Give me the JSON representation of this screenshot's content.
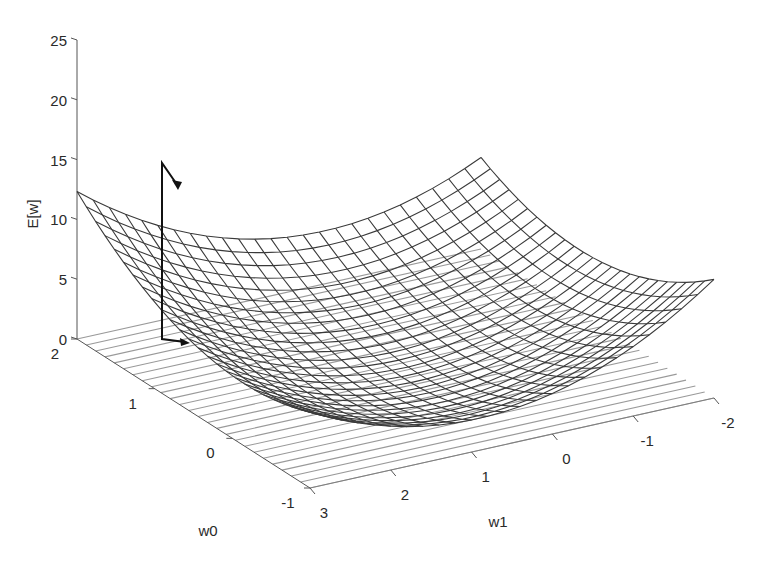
{
  "chart_data": {
    "type": "surface3d",
    "title": "",
    "xlabel": "w0",
    "ylabel": "w1",
    "zlabel": "E[w]",
    "x_ticks": [
      "-1",
      "0",
      "1",
      "2"
    ],
    "y_ticks": [
      "3",
      "2",
      "1",
      "0",
      "-1",
      "-2"
    ],
    "z_ticks": [
      "0",
      "5",
      "10",
      "15",
      "20",
      "25"
    ],
    "xlim": [
      -1,
      2
    ],
    "ylim": [
      -2,
      3
    ],
    "zlim": [
      0,
      25
    ],
    "grid": false,
    "legend": null,
    "surface": {
      "description": "Quadratic error surface (paraboloid bowl) of E[w] over weights w0 and w1, drawn as a wireframe mesh with a contour/line projection on the floor plane",
      "mesh_resolution": [
        25,
        25
      ],
      "corner_values": {
        "w0=2,w1=3": 20.5,
        "w0=2,w1=-2": 7.5,
        "w0=-1,w1=-2": 3.5,
        "w0=-1,w1=3": 14.0
      },
      "minimum_region": {
        "w0": 0.3,
        "w1": 0.5,
        "E": 0.2
      }
    },
    "trajectory": {
      "description": "Gradient descent path shown as a line with arrowheads: drops vertically from the surface near (w0=1.8, w1=2.8, E≈15) to the floor, then moves along the floor plane",
      "points": [
        {
          "w0": 1.85,
          "w1": 2.85,
          "E": 15.0
        },
        {
          "w0": 1.7,
          "w1": 2.6,
          "E": 12.5
        },
        {
          "w0": 1.85,
          "w1": 2.85,
          "E": 0.0
        },
        {
          "w0": 1.75,
          "w1": 2.6,
          "E": 0.0
        }
      ]
    }
  },
  "labels": {
    "z_axis": "E[w]",
    "x_axis": "w0",
    "y_axis": "w1"
  }
}
